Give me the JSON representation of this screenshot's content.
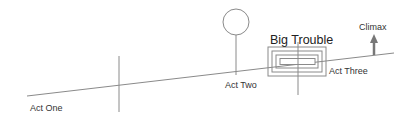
{
  "diagram": {
    "type": "story-structure",
    "colors": {
      "line": "#888888",
      "text": "#333333",
      "arrow": "#777777",
      "background": "#ffffff"
    },
    "labels": {
      "act_one": "Act One",
      "act_two": "Act Two",
      "act_three": "Act Three",
      "big_trouble": "Big Trouble",
      "climax": "Climax"
    },
    "elements": [
      {
        "id": "baseline",
        "kind": "rising-line"
      },
      {
        "id": "act-one-divider",
        "kind": "vertical-line"
      },
      {
        "id": "act-two-marker",
        "kind": "circle-on-stem"
      },
      {
        "id": "big-trouble-marker",
        "kind": "nested-rectangles"
      },
      {
        "id": "climax-marker",
        "kind": "up-arrow"
      }
    ]
  }
}
